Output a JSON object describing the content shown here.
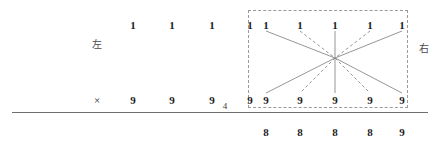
{
  "figure": {
    "background_color": "#ffffff",
    "left_label": "左",
    "right_label": "右",
    "multiply_symbol": "×",
    "carry_digit": "4",
    "rule_color": "#6e6e6e",
    "box_color": "#9a9a9a",
    "line_color": "#8a8a8a"
  },
  "left_group": {
    "top_row": [
      "1",
      "1",
      "1",
      "1"
    ],
    "bottom_row": [
      "9",
      "9",
      "9",
      "9"
    ],
    "top_row_x": [
      133,
      172,
      212,
      250
    ],
    "bottom_row_x": [
      133,
      172,
      212,
      250
    ],
    "top_row_y": 20,
    "bottom_row_y": 95,
    "label_x": 97,
    "label_y": 40
  },
  "right_group": {
    "box": {
      "x": 248,
      "y": 10,
      "width": 160,
      "height": 98
    },
    "top_row": [
      "1",
      "1",
      "1",
      "1",
      "1"
    ],
    "bottom_row": [
      "9",
      "9",
      "9",
      "9",
      "9"
    ],
    "top_row_x": [
      266,
      300,
      335,
      370,
      402
    ],
    "bottom_row_x": [
      266,
      300,
      335,
      370,
      402
    ],
    "top_row_y": 20,
    "bottom_row_y": 95,
    "label_x": 424,
    "label_y": 44,
    "center": {
      "x": 335,
      "y": 58
    },
    "rays": [
      {
        "index": 1,
        "style": "solid",
        "top_x": 266,
        "bottom_x": 266
      },
      {
        "index": 2,
        "style": "dashed",
        "top_x": 300,
        "bottom_x": 300
      },
      {
        "index": 3,
        "style": "solid",
        "top_x": 335,
        "bottom_x": 335
      },
      {
        "index": 4,
        "style": "dashed",
        "top_x": 370,
        "bottom_x": 370
      },
      {
        "index": 5,
        "style": "solid",
        "top_x": 402,
        "bottom_x": 402
      }
    ]
  },
  "result_row": {
    "digits": [
      "8",
      "8",
      "8",
      "8",
      "9"
    ],
    "digits_x": [
      266,
      300,
      335,
      370,
      402
    ],
    "y": 127
  },
  "rule": {
    "x": 12,
    "y": 112,
    "width": 416
  },
  "carry": {
    "x": 225,
    "y": 102
  }
}
